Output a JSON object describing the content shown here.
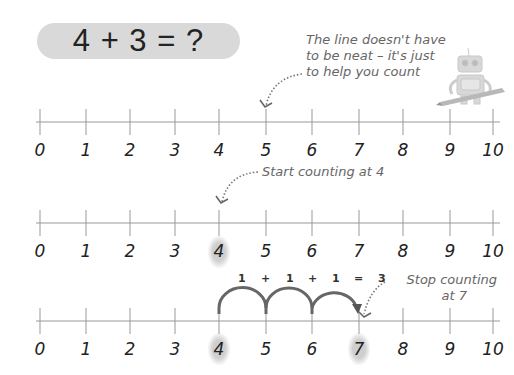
{
  "title": {
    "equation": "4 + 3 = ?"
  },
  "notes": {
    "line_not_neat": [
      "The line doesn't have",
      "to be neat – it's just",
      "to help you count"
    ],
    "start_counting": "Start counting at 4",
    "stop_counting": [
      "Stop counting",
      "at 7"
    ]
  },
  "number_lines": [
    {
      "labels": [
        "0",
        "1",
        "2",
        "3",
        "4",
        "5",
        "6",
        "7",
        "8",
        "9",
        "10"
      ],
      "highlighted": []
    },
    {
      "labels": [
        "0",
        "1",
        "2",
        "3",
        "4",
        "5",
        "6",
        "7",
        "8",
        "9",
        "10"
      ],
      "highlighted": [
        "4"
      ]
    },
    {
      "labels": [
        "0",
        "1",
        "2",
        "3",
        "4",
        "5",
        "6",
        "7",
        "8",
        "9",
        "10"
      ],
      "highlighted": [
        "4",
        "7"
      ]
    }
  ],
  "jumps": {
    "parts": [
      "1",
      "+",
      "1",
      "+",
      "1",
      "=",
      "3"
    ],
    "from": 4,
    "to": 7
  },
  "icons": {
    "mascot": "robot-with-pencil-icon"
  },
  "colors": {
    "pill": "#d9d9d9",
    "arc": "#666666",
    "line": "#999999",
    "note": "#666666"
  }
}
